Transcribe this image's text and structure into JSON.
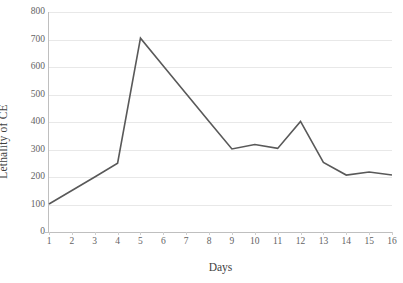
{
  "chart_data": {
    "type": "line",
    "title": "",
    "subtitle": "",
    "xlabel": "Days",
    "ylabel": "Lethality of CE",
    "x": [
      1,
      2,
      3,
      4,
      5,
      6,
      7,
      8,
      9,
      10,
      11,
      12,
      13,
      14,
      15,
      16
    ],
    "xtick_labels": [
      "1",
      "2",
      "3",
      "4",
      "5",
      "6",
      "7",
      "8",
      "9",
      "10",
      "11",
      "12",
      "13",
      "14",
      "15",
      "16"
    ],
    "ytick_labels": [
      "800",
      "700",
      "600",
      "500",
      "400",
      "300",
      "200",
      "100",
      "0"
    ],
    "yticks": [
      800,
      700,
      600,
      500,
      400,
      300,
      200,
      100,
      0
    ],
    "xlim": [
      1,
      16
    ],
    "ylim": [
      0,
      800
    ],
    "grid": "horizontal",
    "legend": "none",
    "series": [
      {
        "name": "Lethality of CE",
        "color": "#595959",
        "values": [
          102,
          151,
          200,
          250,
          705,
          604,
          503,
          402,
          302,
          318,
          304,
          402,
          253,
          207,
          218,
          207
        ]
      }
    ],
    "annotations": []
  },
  "style": {
    "line_color": "#595959",
    "grid_color": "#e8e8e8",
    "axis_color": "#bfbfbf",
    "tick_text_color": "#636363",
    "title_text_color": "#3f3f3f",
    "background": "#ffffff"
  }
}
